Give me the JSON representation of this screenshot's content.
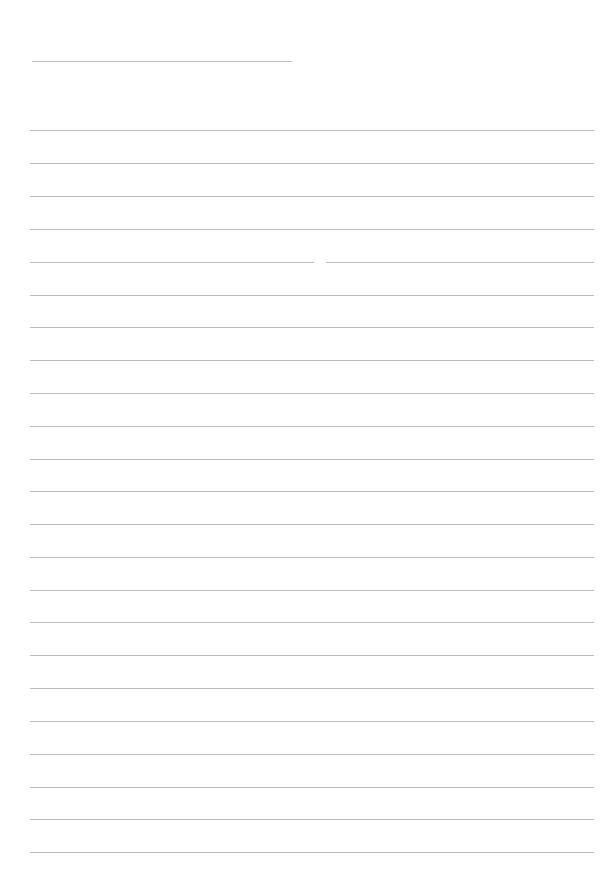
{
  "page": {
    "type": "lined-paper",
    "background": "#ffffff",
    "line_color": "#bdbdbd",
    "header_line": {
      "x": 32,
      "y": 61,
      "width": 260
    },
    "rule_lines_y": [
      130,
      163,
      196,
      229,
      262,
      295,
      327,
      360,
      393,
      426,
      459,
      491,
      524,
      557,
      590,
      622,
      655,
      688,
      721,
      754,
      787,
      819,
      852
    ],
    "split_line_y": 262
  }
}
